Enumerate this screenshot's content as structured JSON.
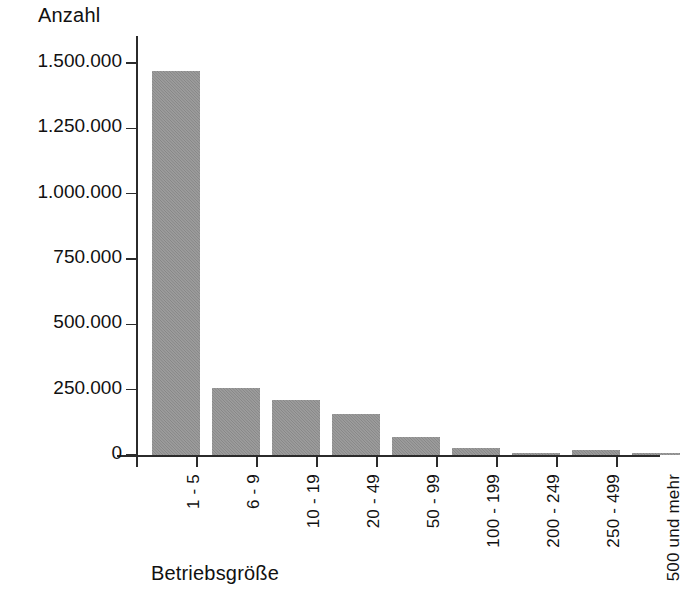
{
  "chart_data": {
    "type": "bar",
    "title": "",
    "subtitle": "",
    "xlabel": "Betriebsgröße",
    "ylabel": "Anzahl",
    "categories": [
      "1 - 5",
      "6 - 9",
      "10 - 19",
      "20 - 49",
      "50 - 99",
      "100 - 199",
      "200 - 249",
      "250 - 499",
      "500 und mehr"
    ],
    "values": [
      1470000,
      255000,
      210000,
      157000,
      68000,
      27000,
      8000,
      18000,
      7000
    ],
    "series": [
      {
        "name": "Anzahl",
        "values": [
          1470000,
          255000,
          210000,
          157000,
          68000,
          27000,
          8000,
          18000,
          7000
        ]
      }
    ],
    "ylim": [
      0,
      1500000
    ],
    "ytick_values": [
      0,
      250000,
      500000,
      750000,
      1000000,
      1250000,
      1500000
    ],
    "ytick_labels": [
      "0",
      "250.000",
      "500.000",
      "750.000",
      "1.000.000",
      "1.250.000",
      "1.500.000"
    ],
    "grid": false,
    "legend": null,
    "bar_color": "#8e8e8e",
    "axis_color": "#2b2b2b",
    "background_color": "#ffffff"
  },
  "axes": {
    "y_title": "Anzahl",
    "x_title": "Betriebsgröße"
  }
}
